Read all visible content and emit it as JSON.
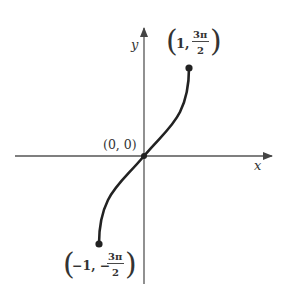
{
  "figure": {
    "type": "function-graph",
    "function": "y = 3·arcsin(x)",
    "axes": {
      "x_label": "x",
      "y_label": "y"
    },
    "points": [
      {
        "name": "top-endpoint",
        "label_x": "1",
        "label_y_num": "3π",
        "label_y_den": "2",
        "label_y_sign": "",
        "x": 1,
        "y": 4.712
      },
      {
        "name": "origin",
        "label": "(0, 0)",
        "x": 0,
        "y": 0
      },
      {
        "name": "bottom-endpoint",
        "label_x": "−1",
        "label_y_num": "3π",
        "label_y_den": "2",
        "label_y_sign": "−",
        "x": -1,
        "y": -4.712
      }
    ],
    "colors": {
      "axis": "#555555",
      "curve": "#222222",
      "text": "#333333"
    }
  },
  "labels": {
    "x_axis": "x",
    "y_axis": "y",
    "origin": "(0, 0)",
    "top": {
      "open": "(",
      "x": "1,",
      "num": "3π",
      "den": "2",
      "close": ")"
    },
    "bottom": {
      "open": "(",
      "x": "−1, −",
      "num": "3π",
      "den": "2",
      "close": ")"
    }
  }
}
